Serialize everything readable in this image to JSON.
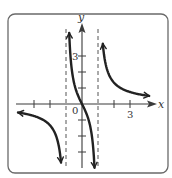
{
  "chart_data": {
    "type": "line",
    "title": "",
    "function": "f(x) = 2x / (x^2 - 1)",
    "xlabel": "x",
    "ylabel": "y",
    "xlim": [
      -4.5,
      4.7
    ],
    "ylim": [
      -4,
      5
    ],
    "x_ticks": [
      -3,
      -2,
      -1,
      1,
      2,
      3
    ],
    "y_ticks": [
      -3,
      -2,
      -1,
      1,
      2,
      3
    ],
    "tick_labels": {
      "x": {
        "0": "0",
        "3": "3"
      },
      "y": {
        "3": "3"
      }
    },
    "vertical_asymptotes": [
      -1,
      1
    ],
    "horizontal_asymptote": 0,
    "grid": false,
    "legend": null,
    "series": [
      {
        "name": "left-branch",
        "x_range": [
          -4.0,
          -1.31
        ],
        "arrows": "both"
      },
      {
        "name": "middle-branch",
        "x_range": [
          -0.8,
          0.78
        ],
        "arrows": "both"
      },
      {
        "name": "right-branch",
        "x_range": [
          1.3,
          4.2
        ],
        "arrows": "both"
      }
    ]
  },
  "labels": {
    "x_axis": "x",
    "y_axis": "y",
    "origin": "0",
    "x_three": "3",
    "y_three": "3"
  }
}
